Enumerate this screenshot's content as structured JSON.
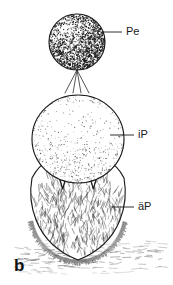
{
  "figure": {
    "panel_letter": "b",
    "background_color": "#ffffff",
    "ink_color": "#1a1a1a",
    "width": 173,
    "height": 285,
    "caption_present": false
  },
  "labels": [
    {
      "id": "pe",
      "text": "Pe",
      "text_x": 126,
      "text_y": 32,
      "leader_x1": 103,
      "leader_y1": 32,
      "leader_x2": 122,
      "leader_y2": 32
    },
    {
      "id": "ip",
      "text": "iP",
      "text_x": 138,
      "text_y": 135,
      "leader_x1": 110,
      "leader_y1": 135,
      "leader_x2": 134,
      "leader_y2": 135
    },
    {
      "id": "aep",
      "text": "äP",
      "text_x": 138,
      "text_y": 207,
      "leader_x1": 112,
      "leader_y1": 207,
      "leader_x2": 134,
      "leader_y2": 207
    }
  ],
  "structures": [
    {
      "id": "pe-sphere",
      "name": "peridium-sphere",
      "shape": "circle",
      "cx": 77,
      "cy": 42,
      "rx": 28,
      "ry": 28,
      "texture": "dense-stipple",
      "highlight_cx": 66,
      "highlight_cy": 32,
      "stipple_count": 2300,
      "shading": "dark with upper-left highlight"
    },
    {
      "id": "stalk-lines",
      "name": "splaying-filaments",
      "shape": "lines",
      "apex_x": 77,
      "apex_y": 70,
      "bottom_y": 93,
      "spread": [
        -12,
        -4,
        4,
        12
      ],
      "count": 4
    },
    {
      "id": "ip-sphere",
      "name": "inner-peridium-sphere",
      "shape": "circle",
      "cx": 78,
      "cy": 139,
      "rx": 46,
      "ry": 44,
      "texture": "light-stipple",
      "stipple_count": 1000,
      "shading": "light, denser toward lower margin"
    },
    {
      "id": "aep-body",
      "name": "outer-peridium-body",
      "shape": "lobed-oval",
      "cx": 78,
      "cy": 212,
      "rx": 46,
      "ry": 48,
      "texture": "hairy",
      "lobe_count": 3,
      "hair_count": 520,
      "notch_count": 2
    },
    {
      "id": "ground",
      "name": "substrate-band",
      "shape": "hatching",
      "y_center": 257,
      "x_start": 14,
      "x_end": 160,
      "dash_count": 150
    }
  ]
}
